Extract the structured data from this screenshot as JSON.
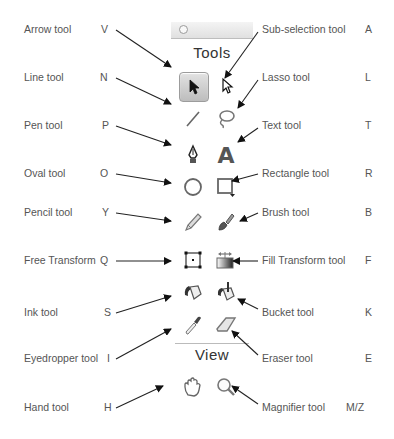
{
  "palette": {
    "tools_title": "Tools",
    "view_title": "View"
  },
  "left_labels": [
    {
      "name": "Arrow tool",
      "key": "V"
    },
    {
      "name": "Line tool",
      "key": "N"
    },
    {
      "name": "Pen tool",
      "key": "P"
    },
    {
      "name": "Oval tool",
      "key": "O"
    },
    {
      "name": "Pencil tool",
      "key": "Y"
    },
    {
      "name": "Free Transform",
      "key": "Q"
    },
    {
      "name": "Ink tool",
      "key": "S"
    },
    {
      "name": "Eyedropper tool",
      "key": "I"
    },
    {
      "name": "Hand tool",
      "key": "H"
    }
  ],
  "right_labels": [
    {
      "name": "Sub-selection tool",
      "key": "A"
    },
    {
      "name": "Lasso tool",
      "key": "L"
    },
    {
      "name": "Text tool",
      "key": "T"
    },
    {
      "name": "Rectangle tool",
      "key": "R"
    },
    {
      "name": "Brush tool",
      "key": "B"
    },
    {
      "name": "Fill Transform tool",
      "key": "F"
    },
    {
      "name": "Bucket tool",
      "key": "K"
    },
    {
      "name": "Eraser tool",
      "key": "E"
    },
    {
      "name": "Magnifier tool",
      "key": "M/Z"
    }
  ],
  "icons": {
    "text_tool_glyph": "A"
  }
}
